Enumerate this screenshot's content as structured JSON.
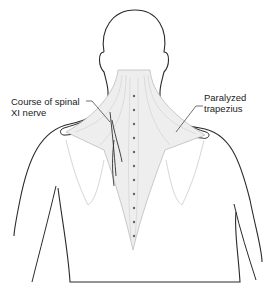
{
  "figure": {
    "type": "anatomical illustration",
    "view": "posterior upper torso, head and neck"
  },
  "labels": {
    "left": {
      "line1": "Course of spinal",
      "line2": "XI nerve"
    },
    "right": {
      "line1": "Paralyzed",
      "line2": "trapezius"
    }
  },
  "colors": {
    "outline": "#2a2a2a",
    "muscle_hatch": "#b8b8b8",
    "background": "#ffffff"
  }
}
